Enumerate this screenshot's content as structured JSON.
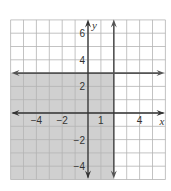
{
  "chart_data": {
    "type": "inequality-graph",
    "title": "",
    "xlabel": "x",
    "ylabel": "y",
    "xlim": [
      -6,
      6
    ],
    "ylim": [
      -5,
      7
    ],
    "grid": true,
    "grid_step": 1,
    "x_tick_labels": [
      {
        "value": -4,
        "label": "−4"
      },
      {
        "value": -2,
        "label": "−2"
      },
      {
        "value": 1,
        "label": "1"
      },
      {
        "value": 4,
        "label": "4"
      }
    ],
    "y_tick_labels": [
      {
        "value": 6,
        "label": "6"
      },
      {
        "value": 4,
        "label": "4"
      },
      {
        "value": 2,
        "label": "2"
      },
      {
        "value": -2,
        "label": "−2"
      },
      {
        "value": -4,
        "label": "−4"
      }
    ],
    "boundary_lines": [
      {
        "equation": "y = 3",
        "orientation": "horizontal",
        "value": 3,
        "style": "solid"
      },
      {
        "equation": "x = 2",
        "orientation": "vertical",
        "value": 2,
        "style": "solid"
      }
    ],
    "shaded_region": {
      "description": "y <= 3 and x <= 2",
      "x_max": 2,
      "y_max": 3
    }
  },
  "colors": {
    "background": "#ffffff",
    "grid": "#b4b4b4",
    "grid_shaded": "#a6a6a6",
    "shade": "#d0d0d0",
    "line": "#555555",
    "axis": "#333333"
  }
}
